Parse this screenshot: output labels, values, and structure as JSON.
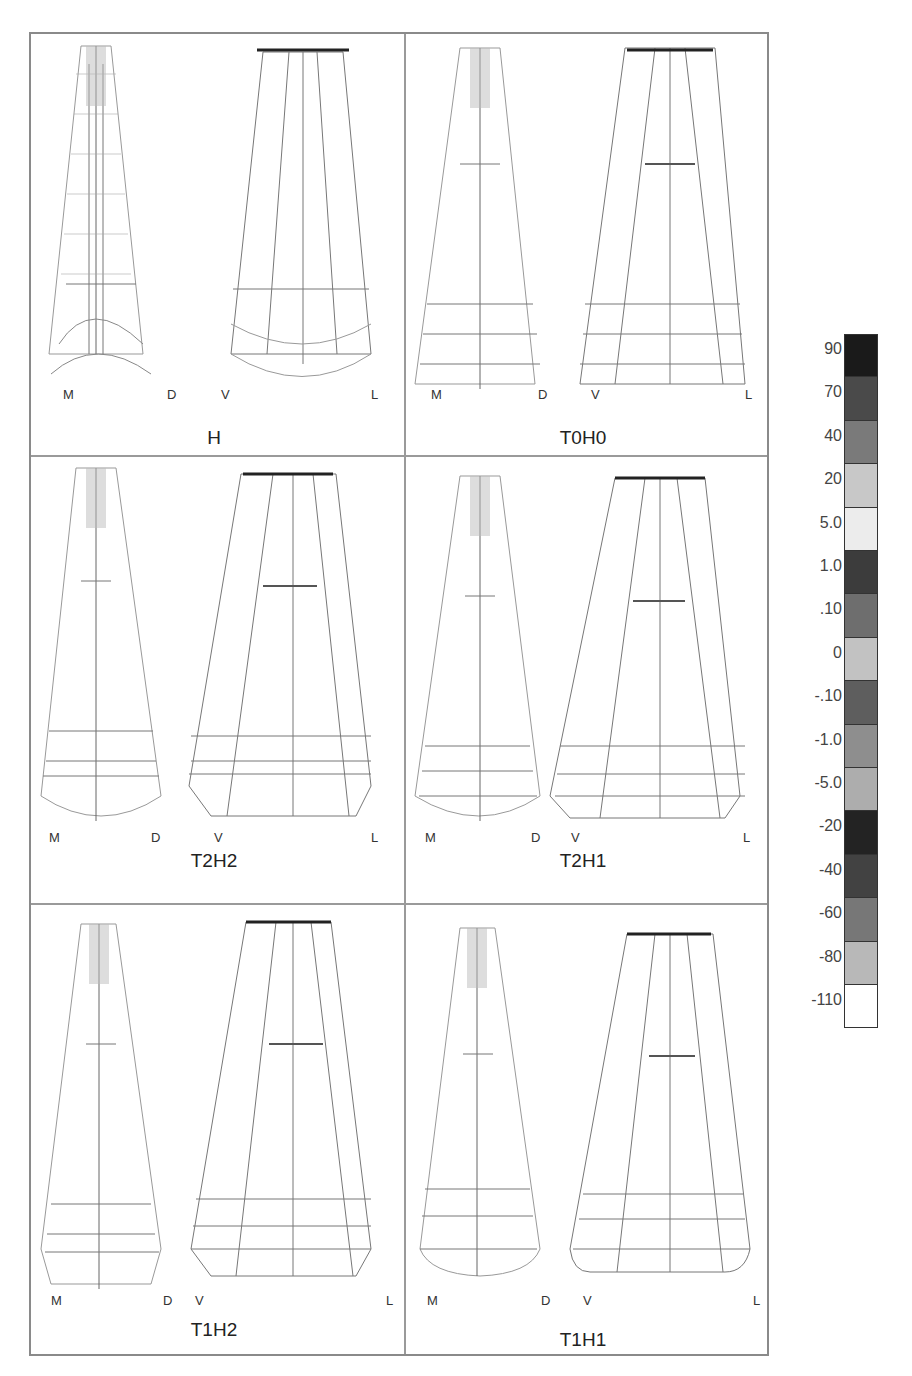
{
  "figure": {
    "panels": [
      {
        "id": "H",
        "title": "H",
        "left_view": {
          "labels": [
            "M",
            "D"
          ]
        },
        "right_view": {
          "labels": [
            "V",
            "L"
          ]
        }
      },
      {
        "id": "T0H0",
        "title": "T0H0",
        "left_view": {
          "labels": [
            "M",
            "D"
          ]
        },
        "right_view": {
          "labels": [
            "V",
            "L"
          ]
        }
      },
      {
        "id": "T2H2",
        "title": "T2H2",
        "left_view": {
          "labels": [
            "M",
            "D"
          ]
        },
        "right_view": {
          "labels": [
            "V",
            "L"
          ]
        }
      },
      {
        "id": "T2H1",
        "title": "T2H1",
        "left_view": {
          "labels": [
            "M",
            "D"
          ]
        },
        "right_view": {
          "labels": [
            "V",
            "L"
          ]
        }
      },
      {
        "id": "T1H2",
        "title": "T1H2",
        "left_view": {
          "labels": [
            "M",
            "D"
          ]
        },
        "right_view": {
          "labels": [
            "V",
            "L"
          ]
        }
      },
      {
        "id": "T1H1",
        "title": "T1H1",
        "left_view": {
          "labels": [
            "M",
            "D"
          ]
        },
        "right_view": {
          "labels": [
            "V",
            "L"
          ]
        }
      }
    ]
  },
  "colorbar": {
    "labels": [
      "90",
      "70",
      "40",
      "20",
      "5.0",
      "1.0",
      ".10",
      "0",
      "-.10",
      "-1.0",
      "-5.0",
      "-20",
      "-40",
      "-60",
      "-80",
      "-110"
    ],
    "bands": [
      "#1a1a1a",
      "#4a4a4a",
      "#7a7a7a",
      "#c8c8c8",
      "#ececec",
      "#3c3c3c",
      "#6e6e6e",
      "#c2c2c2",
      "#5e5e5e",
      "#8e8e8e",
      "#adadad",
      "#232323",
      "#424242",
      "#777777",
      "#b8b8b8",
      "#ffffff"
    ]
  }
}
